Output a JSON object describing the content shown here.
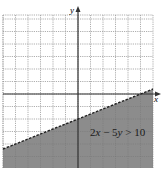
{
  "chart_data": {
    "type": "inequality-graph",
    "title": "",
    "inequality_label": "2x − 5y > 10",
    "boundary": {
      "equation": "2x - 5y = 10",
      "slope": 0.4,
      "y_intercept": -2,
      "x_intercept": 5,
      "style": "dashed"
    },
    "shaded_region": "below",
    "xlabel": "x",
    "ylabel": "y",
    "xlim": [
      -6,
      6
    ],
    "ylim": [
      -6,
      6
    ],
    "grid": true,
    "grid_step": 1,
    "colors": {
      "shade": "#8c8c8c",
      "grid": "#9a9a9a",
      "axis": "#333333",
      "boundary": "#222222"
    }
  },
  "labels": {
    "x_axis": "x",
    "y_axis": "y",
    "inequality": "2x − 5y > 10"
  }
}
